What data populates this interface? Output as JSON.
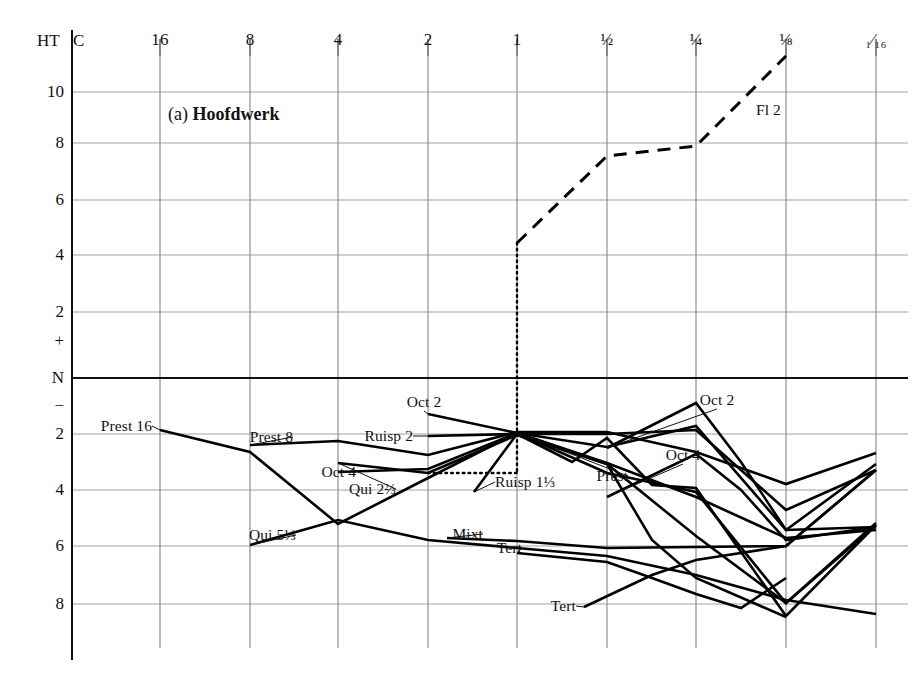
{
  "figure": {
    "title_prefix": "(a)",
    "title_main": "Hoofdwerk",
    "corner_ht": "HT",
    "corner_c": "C"
  },
  "chart_data": {
    "type": "line",
    "title": "(a) Hoofdwerk",
    "xlabel": "",
    "ylabel": "HT",
    "grid": true,
    "legend": "inline-labels",
    "x_axis": {
      "name": "C",
      "tick_labels": [
        "16",
        "8",
        "4",
        "2",
        "1",
        "½",
        "¼",
        "⅛",
        "₁⁄₁₆"
      ],
      "tick_values": [
        16,
        8,
        4,
        2,
        1,
        0.5,
        0.25,
        0.125,
        0.0625
      ],
      "tick_px": [
        160,
        250,
        338,
        428,
        517,
        607,
        696,
        786,
        876
      ]
    },
    "y_axis": {
      "name": "HT",
      "tick_labels": [
        "10",
        "8",
        "6",
        "4",
        "2",
        "+",
        "N",
        "−",
        "2",
        "4",
        "6",
        "8"
      ],
      "tick_px": [
        92,
        143,
        200,
        255,
        312,
        341,
        378,
        406,
        434,
        490,
        546,
        604
      ],
      "zero_label": "N",
      "plus_label": "+",
      "minus_label": "−"
    },
    "series": [
      {
        "name": "Fl 2 (upper)",
        "label": "Fl 2",
        "style": "dashed",
        "label_px": {
          "x": 756,
          "y": 110
        },
        "label_anchor": "start",
        "points_px": [
          [
            517,
            243
          ],
          [
            607,
            156
          ],
          [
            696,
            146
          ],
          [
            786,
            56
          ]
        ]
      },
      {
        "name": "Fl 2 dotted connector",
        "label": "",
        "style": "dotted",
        "points_px": [
          [
            517,
            243
          ],
          [
            517,
            473
          ]
        ]
      },
      {
        "name": "Fl 2 dotted horizontal",
        "label": "",
        "style": "dotted",
        "points_px": [
          [
            428,
            473
          ],
          [
            517,
            473
          ]
        ]
      },
      {
        "name": "Prest 16",
        "label": "Prest 16",
        "style": "solid",
        "label_px": {
          "x": 152,
          "y": 426
        },
        "label_anchor": "end",
        "points_px": [
          [
            160,
            430
          ],
          [
            250,
            452
          ],
          [
            338,
            524
          ],
          [
            428,
            478
          ],
          [
            517,
            433
          ],
          [
            607,
            447
          ],
          [
            696,
            426
          ],
          [
            786,
            530
          ],
          [
            876,
            464
          ]
        ]
      },
      {
        "name": "Prest 8",
        "label": "Prest 8",
        "style": "solid",
        "label_px": {
          "x": 293,
          "y": 437
        },
        "label_anchor": "end",
        "points_px": [
          [
            250,
            445
          ],
          [
            338,
            441
          ],
          [
            428,
            455
          ],
          [
            517,
            432
          ],
          [
            607,
            432
          ],
          [
            696,
            452
          ],
          [
            786,
            484
          ],
          [
            876,
            453
          ]
        ]
      },
      {
        "name": "Oct 4 left",
        "label": "Oct 4",
        "style": "solid",
        "label_px": {
          "x": 356,
          "y": 472
        },
        "label_anchor": "end",
        "points_px": [
          [
            338,
            472
          ],
          [
            428,
            469
          ],
          [
            517,
            433
          ],
          [
            607,
            463
          ],
          [
            696,
            497
          ],
          [
            786,
            538
          ],
          [
            876,
            530
          ]
        ]
      },
      {
        "name": "Qui 5⅓",
        "label": "Qui 5⅓",
        "style": "solid",
        "label_px": {
          "x": 296,
          "y": 535
        },
        "label_anchor": "end",
        "points_px": [
          [
            250,
            545
          ],
          [
            338,
            520
          ],
          [
            428,
            540
          ],
          [
            517,
            548
          ],
          [
            607,
            556
          ],
          [
            696,
            575
          ],
          [
            786,
            600
          ],
          [
            876,
            614
          ]
        ]
      },
      {
        "name": "Qui 2⅔",
        "label": "Qui 2⅔",
        "style": "solid",
        "label_px": {
          "x": 396,
          "y": 489
        },
        "label_anchor": "end",
        "points_px": [
          [
            338,
            463
          ],
          [
            428,
            473
          ],
          [
            517,
            435
          ],
          [
            607,
            464
          ],
          [
            696,
            536
          ],
          [
            786,
            603
          ],
          [
            876,
            525
          ]
        ]
      },
      {
        "name": "Oct 2 left",
        "label": "Oct 2",
        "style": "solid",
        "label_px": {
          "x": 424,
          "y": 402
        },
        "label_anchor": "mid",
        "points_px": [
          [
            428,
            414
          ],
          [
            517,
            433
          ],
          [
            607,
            464
          ],
          [
            652,
            540
          ],
          [
            696,
            578
          ],
          [
            786,
            617
          ]
        ]
      },
      {
        "name": "Ruisp 2",
        "label": "Ruisp 2",
        "style": "solid",
        "label_px": {
          "x": 413,
          "y": 436
        },
        "label_anchor": "end",
        "points_px": [
          [
            428,
            436
          ],
          [
            517,
            434
          ],
          [
            607,
            434
          ],
          [
            696,
            430
          ],
          [
            786,
            510
          ],
          [
            876,
            470
          ]
        ]
      },
      {
        "name": "Ruisp 1⅓",
        "label": "Ruisp 1⅓",
        "style": "solid",
        "label_px": {
          "x": 495,
          "y": 482
        },
        "label_anchor": "start",
        "points_px": [
          [
            474,
            492
          ],
          [
            517,
            434
          ],
          [
            572,
            462
          ],
          [
            607,
            438
          ],
          [
            652,
            485
          ],
          [
            696,
            488
          ],
          [
            786,
            616
          ],
          [
            876,
            525
          ]
        ]
      },
      {
        "name": "Prest",
        "label": "Prest",
        "style": "solid",
        "label_px": {
          "x": 628,
          "y": 476
        },
        "label_anchor": "end",
        "points_px": [
          [
            517,
            433
          ],
          [
            607,
            473
          ],
          [
            696,
            492
          ],
          [
            786,
            603
          ],
          [
            876,
            523
          ]
        ]
      },
      {
        "name": "Oct 2 right",
        "label": "Oct 2",
        "style": "solid",
        "label_px": {
          "x": 717,
          "y": 400
        },
        "label_anchor": "mid",
        "points_px": [
          [
            607,
            448
          ],
          [
            696,
            403
          ],
          [
            741,
            462
          ],
          [
            786,
            530
          ],
          [
            876,
            527
          ]
        ]
      },
      {
        "name": "Oct 4 right",
        "label": "Oct 4",
        "style": "solid",
        "label_px": {
          "x": 683,
          "y": 455
        },
        "label_anchor": "mid",
        "points_px": [
          [
            607,
            497
          ],
          [
            696,
            454
          ],
          [
            741,
            490
          ],
          [
            786,
            540
          ],
          [
            876,
            527
          ]
        ]
      },
      {
        "name": "Mixt",
        "label": "Mixt",
        "style": "solid",
        "label_px": {
          "x": 483,
          "y": 534
        },
        "label_anchor": "end",
        "points_px": [
          [
            447,
            538
          ],
          [
            517,
            541
          ],
          [
            607,
            548
          ],
          [
            696,
            547
          ],
          [
            786,
            546
          ],
          [
            876,
            470
          ]
        ]
      },
      {
        "name": "Tert upper",
        "label": "Tert",
        "style": "solid",
        "label_px": {
          "x": 522,
          "y": 548
        },
        "label_anchor": "end",
        "points_px": [
          [
            517,
            553
          ],
          [
            607,
            562
          ],
          [
            652,
            578
          ],
          [
            696,
            594
          ],
          [
            741,
            608
          ],
          [
            786,
            578
          ]
        ]
      },
      {
        "name": "Tert lower",
        "label": "Tert",
        "style": "solid",
        "label_px": {
          "x": 576,
          "y": 606
        },
        "label_anchor": "end",
        "points_px": [
          [
            584,
            607
          ],
          [
            652,
            575
          ],
          [
            696,
            560
          ],
          [
            786,
            546
          ],
          [
            876,
            470
          ]
        ]
      }
    ],
    "annotations": [
      {
        "text": "(a) Hoofdwerk",
        "px": {
          "x": 168,
          "y": 116
        }
      }
    ]
  }
}
